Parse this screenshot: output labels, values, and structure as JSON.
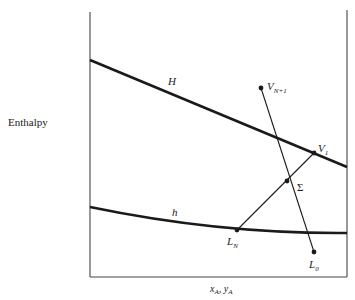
{
  "diagram": {
    "type": "ponchon-savarit-enthalpy-diagram",
    "y_axis_label": "Enthalpy",
    "x_axis_label": "x_A, y_A",
    "x_axis_label_parts": {
      "x": "x",
      "x_sub": "A",
      "sep": ", ",
      "y": "y",
      "y_sub": "A"
    },
    "curves": [
      {
        "id": "H",
        "label": "H",
        "description": "saturated vapor enthalpy line"
      },
      {
        "id": "h",
        "label": "h",
        "description": "saturated liquid enthalpy curve"
      }
    ],
    "points": [
      {
        "id": "V_N+1",
        "label": "V",
        "subscript": "N+1"
      },
      {
        "id": "V_1",
        "label": "V",
        "subscript": "1"
      },
      {
        "id": "Sigma",
        "label": "Σ",
        "subscript": ""
      },
      {
        "id": "L_N",
        "label": "L",
        "subscript": "N"
      },
      {
        "id": "L_0",
        "label": "L",
        "subscript": "0"
      }
    ],
    "lines": [
      {
        "from": "V_N+1",
        "to": "L_0"
      },
      {
        "from": "V_1",
        "to": "L_N"
      }
    ],
    "colors": {
      "ink": "#1a1a1a",
      "frame": "#555555"
    }
  }
}
